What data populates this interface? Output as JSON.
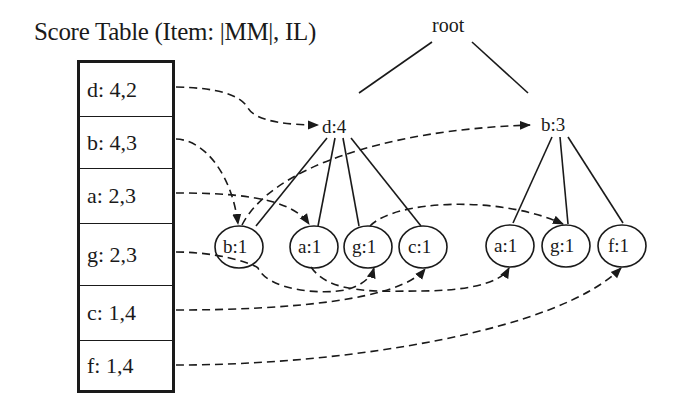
{
  "title": "Score Table (Item: |MM|, IL)",
  "score_table": {
    "rows": [
      {
        "label": "d: 4,2",
        "top": 0,
        "height": 53
      },
      {
        "label": "b: 4,3",
        "top": 53,
        "height": 52
      },
      {
        "label": "a: 2,3",
        "top": 105,
        "height": 55
      },
      {
        "label": "g: 2,3",
        "top": 160,
        "height": 62
      },
      {
        "label": "c: 1,4",
        "top": 222,
        "height": 55
      },
      {
        "label": "f: 1,4",
        "top": 277,
        "height": 53
      }
    ]
  },
  "tree": {
    "root": "root",
    "branches": [
      {
        "label": "d:4",
        "children": [
          "b:1",
          "a:1",
          "g:1",
          "c:1"
        ]
      },
      {
        "label": "b:3",
        "children": [
          "a:1",
          "g:1",
          "f:1"
        ]
      }
    ]
  },
  "nodes": {
    "d4": "d:4",
    "b3": "b:3",
    "d_b1": "b:1",
    "d_a1": "a:1",
    "d_g1": "g:1",
    "d_c1": "c:1",
    "b_a1": "a:1",
    "b_g1": "g:1",
    "b_f1": "f:1"
  },
  "colors": {
    "line": "#1a1a1a",
    "background": "#ffffff"
  }
}
